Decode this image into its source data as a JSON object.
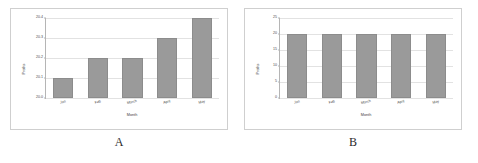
{
  "figure": {
    "panels": [
      {
        "letter": "A",
        "chart_data": {
          "type": "bar",
          "title": "",
          "xlabel": "Month",
          "ylabel": "Profits",
          "categories": [
            "Jan",
            "Feb",
            "March",
            "April",
            "May"
          ],
          "values": [
            20.1,
            20.2,
            20.2,
            20.3,
            20.4
          ],
          "ylim": [
            20.0,
            20.4
          ],
          "yticks": [
            20.0,
            20.1,
            20.2,
            20.3,
            20.4
          ],
          "ytick_labels": [
            "20.0",
            "20.1",
            "20.2",
            "20.3",
            "20.4"
          ],
          "grid": true,
          "legend": "none",
          "bar_color": "#9a9a9a"
        }
      },
      {
        "letter": "B",
        "chart_data": {
          "type": "bar",
          "title": "",
          "xlabel": "Month",
          "ylabel": "Profits",
          "categories": [
            "Jan",
            "Feb",
            "March",
            "April",
            "May"
          ],
          "values": [
            20,
            20,
            20,
            20,
            20
          ],
          "ylim": [
            0,
            25
          ],
          "yticks": [
            0,
            5,
            10,
            15,
            20,
            25
          ],
          "ytick_labels": [
            "0",
            "5",
            "10",
            "15",
            "20",
            "25"
          ],
          "grid": true,
          "legend": "none",
          "bar_color": "#9a9a9a"
        }
      }
    ]
  }
}
